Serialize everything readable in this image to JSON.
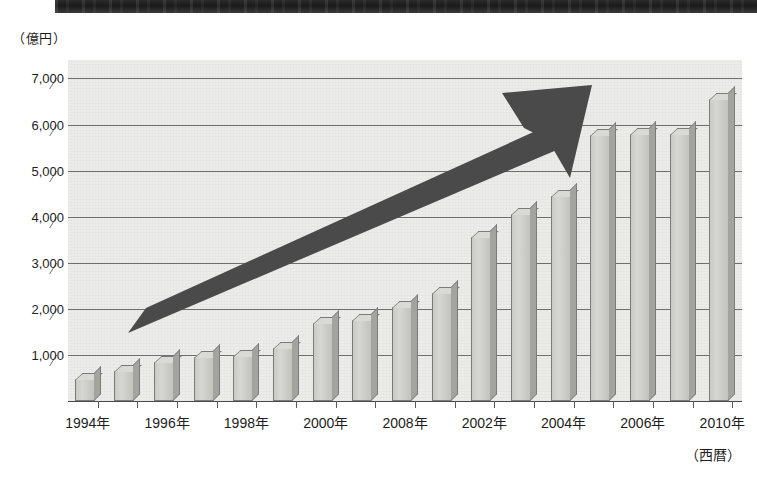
{
  "scan_artifact": {
    "present": true
  },
  "axis": {
    "unit_label": "（億円）",
    "era_label": "（西暦）"
  },
  "chart_data": {
    "type": "bar",
    "title": "",
    "subtitle": "",
    "xlabel": "（西暦）",
    "ylabel": "（億円）",
    "ylim": [
      0,
      7400
    ],
    "grid": true,
    "legend": null,
    "y_ticks": [
      1000,
      2000,
      3000,
      4000,
      5000,
      6000,
      7000
    ],
    "y_tick_labels": [
      "1,000",
      "2,000",
      "3,000",
      "4,000",
      "5,000",
      "6,000",
      "7,000"
    ],
    "categories": [
      "1994",
      "1995",
      "1996",
      "1997",
      "1998",
      "1999",
      "2000",
      "2001",
      "2002",
      "2003",
      "2004",
      "2005",
      "2006",
      "2007",
      "2008",
      "2009",
      "2010"
    ],
    "values": [
      480,
      650,
      850,
      950,
      980,
      1150,
      1700,
      1750,
      2050,
      2350,
      3550,
      4050,
      4450,
      5780,
      5800,
      5800,
      6550
    ],
    "x_tick_labels": [
      "1994年",
      "1996年",
      "1998年",
      "2000年",
      "2008年",
      "2002年",
      "2004年",
      "2006年",
      "2010年"
    ],
    "annotations": [
      {
        "type": "arrow",
        "label": "",
        "direction": "up-right",
        "color": "#4a4a4a"
      }
    ]
  },
  "colors": {
    "bar_face": "#d0d0cd",
    "bar_side": "#a3a3a0",
    "bar_outline": "#7b7b78",
    "plot_bg": "#ececeb",
    "gridline": "#6f6f6f",
    "arrow": "#4a4a4a",
    "scan_bar": "#222222"
  }
}
